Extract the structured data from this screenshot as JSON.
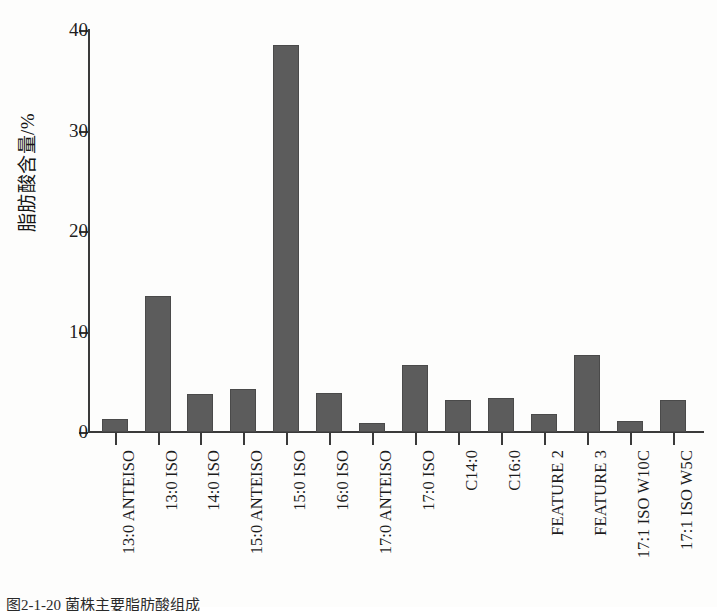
{
  "chart_data": {
    "type": "bar",
    "title": "",
    "xlabel": "",
    "ylabel": "脂肪酸含量/%",
    "ylim": [
      0,
      40
    ],
    "yticks": [
      0,
      10,
      20,
      30,
      40
    ],
    "grid": false,
    "legend": "none",
    "bar_color": "#5c5c5c",
    "categories": [
      "13:0 ANTEISO",
      "13:0 ISO",
      "14:0 ISO",
      "15:0 ANTEISO",
      "15:0 ISO",
      "16:0 ISO",
      "17:0 ANTEISO",
      "17:0 ISO",
      "C14:0",
      "C16:0",
      "FEATURE 2",
      "FEATURE 3",
      "17:1 ISO W10C",
      "17:1 ISO W5C"
    ],
    "values": [
      1.3,
      13.5,
      3.8,
      4.3,
      38.5,
      3.9,
      0.9,
      6.7,
      3.2,
      3.4,
      1.8,
      7.7,
      1.1,
      3.2
    ]
  },
  "figure": {
    "caption": "图2-1-20 菌株主要脂肪酸组成"
  }
}
